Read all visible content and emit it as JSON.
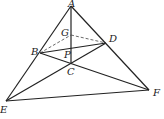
{
  "diagram": {
    "points": {
      "A": {
        "x": 71,
        "y": 6,
        "label": "A",
        "lx": 68,
        "ly": -1
      },
      "G": {
        "x": 71,
        "y": 35,
        "label": "G",
        "lx": 61,
        "ly": 28
      },
      "D": {
        "x": 106,
        "y": 43,
        "label": "D",
        "lx": 109,
        "ly": 34
      },
      "B": {
        "x": 40,
        "y": 53,
        "label": "B",
        "lx": 31,
        "ly": 47
      },
      "P": {
        "x": 71,
        "y": 49,
        "label": "P",
        "lx": 64,
        "ly": 50
      },
      "C": {
        "x": 71,
        "y": 63,
        "label": "C",
        "lx": 67,
        "ly": 67
      },
      "E": {
        "x": 6,
        "y": 101,
        "label": "E",
        "lx": 0,
        "ly": 105
      },
      "F": {
        "x": 149,
        "y": 90,
        "label": "F",
        "lx": 153,
        "ly": 88
      }
    },
    "solid_segments": [
      [
        "A",
        "E"
      ],
      [
        "A",
        "F"
      ],
      [
        "E",
        "F"
      ],
      [
        "E",
        "D"
      ],
      [
        "B",
        "F"
      ],
      [
        "A",
        "C"
      ],
      [
        "B",
        "D"
      ]
    ],
    "dashed_segments": [
      [
        "B",
        "G"
      ],
      [
        "G",
        "D"
      ]
    ],
    "labels": {
      "A": "A",
      "B": "B",
      "C": "C",
      "D": "D",
      "E": "E",
      "F": "F",
      "G": "G",
      "P": "P"
    }
  }
}
